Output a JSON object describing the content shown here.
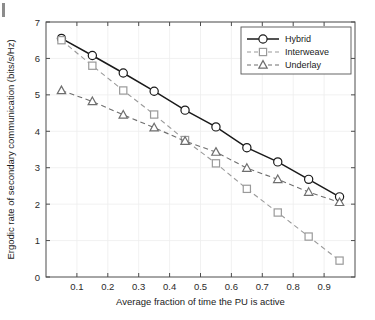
{
  "figure": {
    "page_marker": "page-edge-mark",
    "background": "#ffffff"
  },
  "chart_data": {
    "type": "line",
    "title": "",
    "xlabel": "Average fraction of time the PU is active",
    "ylabel": "Ergodic rate of secondary communication (bits/s/Hz)",
    "xlim": [
      0.0,
      1.0
    ],
    "ylim": [
      0,
      7
    ],
    "xticks": [
      0.1,
      0.2,
      0.3,
      0.4,
      0.5,
      0.6,
      0.7,
      0.8,
      0.9
    ],
    "xticklabels": [
      "0.1",
      "0.2",
      "0.3",
      "0.4",
      "0.5",
      "0.6",
      "0.7",
      "0.8",
      "0.9"
    ],
    "yticks": [
      0,
      1,
      2,
      3,
      4,
      5,
      6,
      7
    ],
    "yticklabels": [
      "0",
      "1",
      "2",
      "3",
      "4",
      "5",
      "6",
      "7"
    ],
    "grid": true,
    "legend_position": "upper right",
    "x": [
      0.05,
      0.15,
      0.25,
      0.35,
      0.45,
      0.55,
      0.65,
      0.75,
      0.85,
      0.95
    ],
    "series": [
      {
        "name": "Hybrid",
        "values": [
          6.55,
          6.08,
          5.6,
          5.1,
          4.58,
          4.12,
          3.55,
          3.16,
          2.68,
          2.2
        ],
        "color": "#1a1a1a",
        "linestyle": "solid",
        "marker": "circle"
      },
      {
        "name": "Interweave",
        "values": [
          6.5,
          5.8,
          5.12,
          4.46,
          3.76,
          3.12,
          2.42,
          1.77,
          1.11,
          0.45
        ],
        "color": "#9a9a9a",
        "linestyle": "dashed",
        "marker": "square"
      },
      {
        "name": "Underlay",
        "values": [
          5.12,
          4.82,
          4.45,
          4.1,
          3.73,
          3.43,
          2.99,
          2.68,
          2.33,
          2.05
        ],
        "color": "#6e6e6e",
        "linestyle": "dashed",
        "marker": "triangle"
      }
    ]
  }
}
